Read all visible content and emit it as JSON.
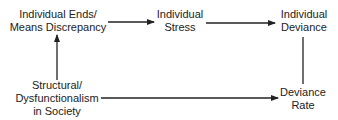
{
  "diagram": {
    "type": "flow",
    "nodes": [
      {
        "id": "ends-means",
        "lines": [
          "Individual Ends/",
          "Means Discrepancy"
        ]
      },
      {
        "id": "stress",
        "lines": [
          "Individual",
          "Stress"
        ]
      },
      {
        "id": "ind-deviance",
        "lines": [
          "Individual",
          "Deviance"
        ]
      },
      {
        "id": "structural",
        "lines": [
          "Structural/",
          "Dysfunctionalism",
          "in Society"
        ]
      },
      {
        "id": "deviance-rate",
        "lines": [
          "Deviance",
          "Rate"
        ]
      }
    ],
    "edges": [
      {
        "from": "structural",
        "to": "ends-means",
        "arrow": true
      },
      {
        "from": "ends-means",
        "to": "stress",
        "arrow": true
      },
      {
        "from": "stress",
        "to": "ind-deviance",
        "arrow": true
      },
      {
        "from": "ind-deviance",
        "to": "deviance-rate",
        "arrow": false
      },
      {
        "from": "structural",
        "to": "deviance-rate",
        "arrow": true
      }
    ],
    "colors": {
      "line": "#222222",
      "text": "#222222",
      "background": "#ffffff"
    }
  }
}
